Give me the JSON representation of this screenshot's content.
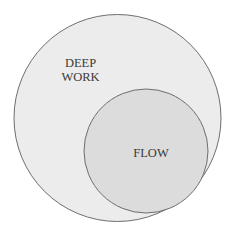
{
  "diagram": {
    "type": "nested-venn",
    "outer": {
      "label_lines": [
        "DEEP",
        "WORK"
      ],
      "fill": "#ececec",
      "stroke": "#6e6e6e"
    },
    "inner": {
      "label": "FLOW",
      "fill": "#dcdcdc",
      "stroke": "#6e6e6e"
    }
  }
}
